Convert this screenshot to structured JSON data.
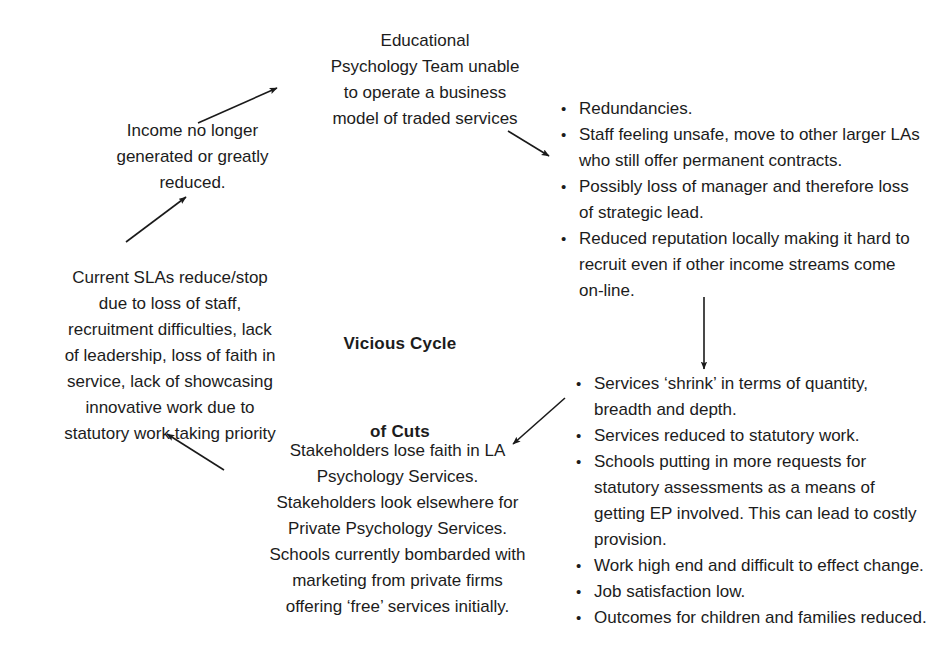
{
  "diagram": {
    "title_line1": "Vicious Cycle",
    "title_line2": "of Cuts",
    "nodes": {
      "educational_psychology_team": "Educational\nPsychology Team unable\nto operate a business\nmodel of traded services",
      "income_no_longer": "Income no longer\ngenerated or greatly\nreduced.",
      "current_slas": "Current SLAs reduce/stop\ndue to loss of staff,\nrecruitment difficulties, lack\nof leadership, loss of faith in\nservice, lack of showcasing\ninnovative work due to\nstatutory work taking priority",
      "stakeholders": "Stakeholders lose faith in LA\nPsychology Services.\nStakeholders look elsewhere for\nPrivate Psychology Services.\nSchools currently bombarded with\nmarketing from private firms\noffering ‘free’ services initially."
    },
    "staffing_impacts": {
      "bullet_glyph": "•",
      "items": [
        "Redundancies.",
        "Staff feeling unsafe, move to other larger LAs who still offer permanent contracts.",
        "Possibly loss of manager and therefore loss of strategic lead.",
        "Reduced reputation locally making it hard to recruit even if other income streams come on-line."
      ]
    },
    "service_impacts": {
      "bullet_glyph": "•",
      "items": [
        "Services ‘shrink’ in terms of quantity, breadth and depth.",
        "Services reduced to statutory work.",
        "Schools putting in more requests for statutory assessments as a means of getting EP involved. This can lead to costly provision.",
        "Work high end and difficult to effect change.",
        "Job satisfaction low.",
        "Outcomes for children and families reduced."
      ]
    },
    "arrows": [
      {
        "name": "income-to-ep-team",
        "x1": 198,
        "y1": 123,
        "x2": 277,
        "y2": 88
      },
      {
        "name": "ep-team-to-staffing",
        "x1": 508,
        "y1": 131,
        "x2": 549,
        "y2": 156
      },
      {
        "name": "staffing-to-services",
        "x1": 704,
        "y1": 297,
        "x2": 704,
        "y2": 369
      },
      {
        "name": "services-to-stakeholders",
        "x1": 565,
        "y1": 398,
        "x2": 513,
        "y2": 444
      },
      {
        "name": "stakeholders-to-slas",
        "x1": 224,
        "y1": 470,
        "x2": 167,
        "y2": 434
      },
      {
        "name": "slas-to-income",
        "x1": 126,
        "y1": 242,
        "x2": 186,
        "y2": 197
      }
    ],
    "colors": {
      "text": "#1c1c1c",
      "arrow": "#1a1a1a",
      "background": "#ffffff"
    }
  }
}
